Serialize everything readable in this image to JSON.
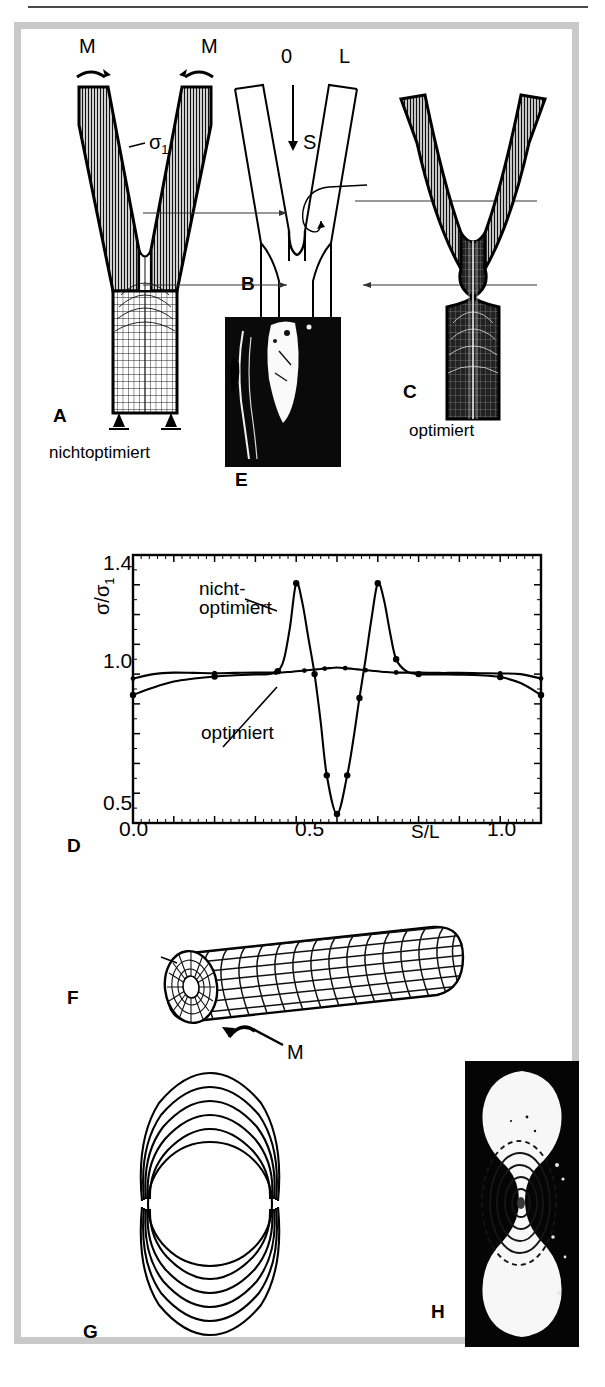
{
  "figure": {
    "panels": [
      {
        "id": "A",
        "letter": "A",
        "caption": "nichtoptimiert",
        "description": "finite-element mesh of a non-optimised bifurcation (tree fork) under bending moments"
      },
      {
        "id": "B",
        "letter": "B",
        "caption": "",
        "description": "outline of the fork showing the notch path coordinate"
      },
      {
        "id": "C",
        "letter": "C",
        "caption": "optimiert",
        "description": "finite-element mesh of the shape-optimised bifurcation"
      },
      {
        "id": "D",
        "letter": "D",
        "caption": "",
        "description": "stress ratio along the notch contour"
      },
      {
        "id": "E",
        "letter": "E",
        "caption": "",
        "description": "photograph of a natural tree fork"
      },
      {
        "id": "F",
        "letter": "F",
        "caption": "",
        "description": "finite-element mesh of a cylinder loaded in torsion"
      },
      {
        "id": "G",
        "letter": "G",
        "caption": "",
        "description": "nested optimised contour shapes of the notch cross-section"
      },
      {
        "id": "H",
        "letter": "H",
        "caption": "",
        "description": "photoelastic image of the optimised notch"
      }
    ],
    "labels": {
      "moment_left": "M",
      "moment_right": "M",
      "sigma1": "σ",
      "sigma1_sub": "1",
      "origin": "0",
      "length": "L",
      "path": "S",
      "torsion_moment": "M"
    }
  },
  "chart_data": {
    "type": "line",
    "title": "",
    "xlabel": "S/L",
    "ylabel": "σ/σ1",
    "xlim": [
      0.0,
      1.0
    ],
    "ylim": [
      0.5,
      1.4
    ],
    "grid": false,
    "legend": "inline-annotations",
    "xticks": [
      0.0,
      0.5,
      1.0
    ],
    "xticklabels": [
      "0.0",
      "0.5",
      "1.0"
    ],
    "yticks": [
      0.5,
      1.0,
      1.4
    ],
    "yticklabels": [
      "0.5",
      "1.0",
      "1.4"
    ],
    "annotations": [
      {
        "text": "nicht-",
        "series": "nichtoptimiert"
      },
      {
        "text": "optimiert",
        "series": "nichtoptimiert"
      },
      {
        "text": "optimiert",
        "series": "optimiert"
      }
    ],
    "series": [
      {
        "name": "nichtoptimiert",
        "x": [
          0.0,
          0.05,
          0.1,
          0.15,
          0.2,
          0.25,
          0.3,
          0.33,
          0.355,
          0.37,
          0.385,
          0.4,
          0.415,
          0.43,
          0.445,
          0.46,
          0.475,
          0.5,
          0.525,
          0.54,
          0.555,
          0.57,
          0.585,
          0.6,
          0.615,
          0.63,
          0.645,
          0.67,
          0.7,
          0.75,
          0.8,
          0.85,
          0.9,
          0.95,
          1.0
        ],
        "y": [
          0.93,
          0.955,
          0.975,
          0.985,
          0.992,
          0.996,
          0.999,
          1.0,
          1.01,
          1.05,
          1.16,
          1.305,
          1.24,
          1.12,
          1.0,
          0.84,
          0.66,
          0.53,
          0.66,
          0.78,
          0.92,
          1.05,
          1.19,
          1.305,
          1.25,
          1.14,
          1.05,
          1.01,
          1.0,
          0.999,
          0.998,
          0.996,
          0.99,
          0.97,
          0.93
        ]
      },
      {
        "name": "optimiert",
        "x": [
          0.0,
          0.05,
          0.1,
          0.15,
          0.2,
          0.25,
          0.3,
          0.35,
          0.38,
          0.42,
          0.45,
          0.48,
          0.5,
          0.52,
          0.55,
          0.58,
          0.62,
          0.65,
          0.7,
          0.75,
          0.8,
          0.85,
          0.9,
          0.95,
          1.0
        ],
        "y": [
          0.985,
          1.0,
          1.005,
          1.004,
          1.003,
          1.004,
          1.005,
          1.005,
          1.007,
          1.012,
          1.016,
          1.02,
          1.022,
          1.02,
          1.016,
          1.012,
          1.007,
          1.005,
          1.005,
          1.004,
          1.004,
          1.003,
          1.002,
          1.0,
          0.985
        ]
      }
    ],
    "markers": {
      "nichtoptimiert_x": [
        0.0,
        0.2,
        0.355,
        0.4,
        0.445,
        0.475,
        0.5,
        0.525,
        0.555,
        0.6,
        0.645,
        0.7,
        0.9,
        1.0
      ],
      "optimiert_x": [
        0.0,
        0.2,
        0.35,
        0.42,
        0.47,
        0.52,
        0.57,
        0.645,
        0.9,
        1.0
      ]
    }
  }
}
